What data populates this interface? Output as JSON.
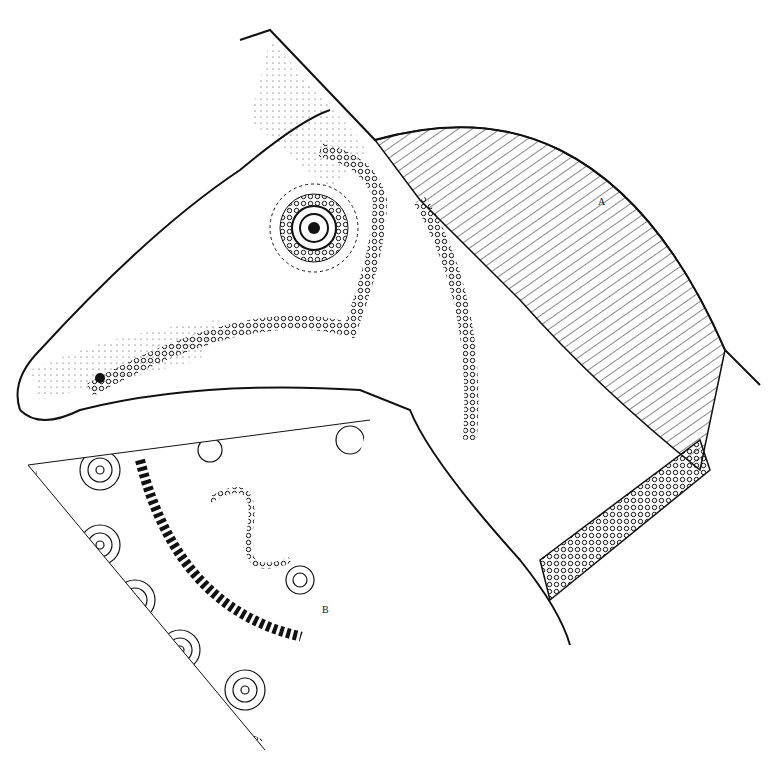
{
  "figure": {
    "labels": {
      "a": "A",
      "b": "B"
    },
    "colors": {
      "ink": "#111111",
      "paper": "#ffffff"
    }
  }
}
